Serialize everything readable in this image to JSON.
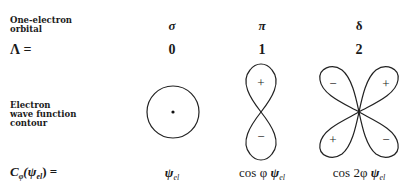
{
  "row_labels": {
    "orbital": [
      "One-electron",
      "orbital"
    ],
    "lambda": "Λ =",
    "contour": [
      "Electron",
      "wave function",
      "contour"
    ],
    "symmetry": {
      "base": "C",
      "sub": "φ",
      "arg": "(ψ",
      "arg_sub": "el",
      "close": ") ="
    }
  },
  "columns": [
    {
      "orbital": "σ",
      "lambda": "0",
      "contour": "circle",
      "signs": [],
      "symmetry": {
        "prefix": "",
        "psi": "ψ",
        "sub": "el"
      }
    },
    {
      "orbital": "π",
      "lambda": "1",
      "contour": "two-lobes-vertical",
      "signs": [
        "+",
        "−"
      ],
      "symmetry": {
        "prefix": "cos φ ",
        "psi": "ψ",
        "sub": "el"
      }
    },
    {
      "orbital": "δ",
      "lambda": "2",
      "contour": "four-lobes-diagonal",
      "signs": [
        "−",
        "+",
        "+",
        "−"
      ],
      "symmetry": {
        "prefix": "cos 2φ ",
        "psi": "ψ",
        "sub": "el"
      }
    }
  ]
}
